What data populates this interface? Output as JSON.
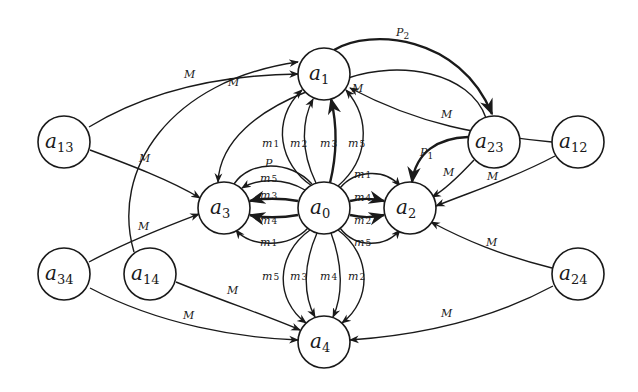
{
  "diagram": {
    "type": "directed-graph",
    "nodes": [
      {
        "id": "a1",
        "base": "a",
        "sub": "1",
        "x": 324,
        "y": 74
      },
      {
        "id": "a13",
        "base": "a",
        "sub": "13",
        "x": 64,
        "y": 142
      },
      {
        "id": "a23",
        "base": "a",
        "sub": "23",
        "x": 494,
        "y": 142
      },
      {
        "id": "a12",
        "base": "a",
        "sub": "12",
        "x": 578,
        "y": 142
      },
      {
        "id": "a3",
        "base": "a",
        "sub": "3",
        "x": 224,
        "y": 208
      },
      {
        "id": "a0",
        "base": "a",
        "sub": "0",
        "x": 324,
        "y": 208
      },
      {
        "id": "a2",
        "base": "a",
        "sub": "2",
        "x": 410,
        "y": 208
      },
      {
        "id": "a34",
        "base": "a",
        "sub": "34",
        "x": 64,
        "y": 274
      },
      {
        "id": "a14",
        "base": "a",
        "sub": "14",
        "x": 150,
        "y": 274
      },
      {
        "id": "a24",
        "base": "a",
        "sub": "24",
        "x": 578,
        "y": 274
      },
      {
        "id": "a4",
        "base": "a",
        "sub": "4",
        "x": 324,
        "y": 342
      }
    ],
    "edges": [
      {
        "from": "a1",
        "to": "a23",
        "base": "P",
        "sub": "2",
        "style": "thick"
      },
      {
        "from": "a23",
        "to": "a2",
        "base": "P",
        "sub": "1",
        "style": "thick"
      },
      {
        "from": "a13",
        "to": "a1",
        "base": "M",
        "sub": ""
      },
      {
        "from": "a14",
        "to": "a1",
        "base": "M",
        "sub": ""
      },
      {
        "from": "a13",
        "to": "a3",
        "base": "M",
        "sub": ""
      },
      {
        "from": "a34",
        "to": "a3",
        "base": "M",
        "sub": ""
      },
      {
        "from": "a34",
        "to": "a4",
        "base": "M",
        "sub": ""
      },
      {
        "from": "a14",
        "to": "a4",
        "base": "M",
        "sub": ""
      },
      {
        "from": "a12",
        "to": "a1",
        "base": "M",
        "sub": ""
      },
      {
        "from": "a23",
        "to": "a1",
        "base": "M",
        "sub": ""
      },
      {
        "from": "a23",
        "to": "a2",
        "base": "M",
        "sub": ""
      },
      {
        "from": "a12",
        "to": "a2",
        "base": "M",
        "sub": ""
      },
      {
        "from": "a24",
        "to": "a2",
        "base": "M",
        "sub": ""
      },
      {
        "from": "a24",
        "to": "a4",
        "base": "M",
        "sub": ""
      },
      {
        "from": "a1",
        "to": "a3",
        "base": "",
        "sub": ""
      },
      {
        "from": "a0",
        "to": "a1",
        "base": "m",
        "sub": "1"
      },
      {
        "from": "a0",
        "to": "a1",
        "base": "m",
        "sub": "2"
      },
      {
        "from": "a0",
        "to": "a1",
        "base": "m",
        "sub": "3"
      },
      {
        "from": "a0",
        "to": "a1",
        "base": "m",
        "sub": "5"
      },
      {
        "from": "a0",
        "to": "a2",
        "base": "m",
        "sub": "1"
      },
      {
        "from": "a0",
        "to": "a2",
        "base": "m",
        "sub": "4"
      },
      {
        "from": "a0",
        "to": "a2",
        "base": "m",
        "sub": "2"
      },
      {
        "from": "a0",
        "to": "a2",
        "base": "m",
        "sub": "5"
      },
      {
        "from": "a0",
        "to": "a3",
        "base": "P",
        "sub": ""
      },
      {
        "from": "a0",
        "to": "a3",
        "base": "m",
        "sub": "5"
      },
      {
        "from": "a0",
        "to": "a3",
        "base": "m",
        "sub": "3"
      },
      {
        "from": "a0",
        "to": "a3",
        "base": "m",
        "sub": "4"
      },
      {
        "from": "a0",
        "to": "a3",
        "base": "m",
        "sub": "1"
      },
      {
        "from": "a0",
        "to": "a4",
        "base": "m",
        "sub": "5"
      },
      {
        "from": "a0",
        "to": "a4",
        "base": "m",
        "sub": "3"
      },
      {
        "from": "a0",
        "to": "a4",
        "base": "m",
        "sub": "4"
      },
      {
        "from": "a0",
        "to": "a4",
        "base": "m",
        "sub": "2"
      }
    ]
  },
  "labels": {
    "P2": {
      "base": "P",
      "sub": "2"
    },
    "P1": {
      "base": "P",
      "sub": "1"
    },
    "M": "M",
    "top": [
      {
        "base": "m",
        "sub": "1"
      },
      {
        "base": "m",
        "sub": "2"
      },
      {
        "base": "m",
        "sub": "3"
      },
      {
        "base": "m",
        "sub": "5"
      }
    ],
    "bottom": [
      {
        "base": "m",
        "sub": "5"
      },
      {
        "base": "m",
        "sub": "3"
      },
      {
        "base": "m",
        "sub": "4"
      },
      {
        "base": "m",
        "sub": "2"
      }
    ],
    "right": [
      {
        "base": "m",
        "sub": "1"
      },
      {
        "base": "m",
        "sub": "4"
      },
      {
        "base": "m",
        "sub": "2"
      },
      {
        "base": "m",
        "sub": "5"
      }
    ],
    "left": [
      {
        "base": "P",
        "sub": ""
      },
      {
        "base": "m",
        "sub": "5"
      },
      {
        "base": "m",
        "sub": "3"
      },
      {
        "base": "m",
        "sub": "4"
      },
      {
        "base": "m",
        "sub": "1"
      }
    ]
  }
}
